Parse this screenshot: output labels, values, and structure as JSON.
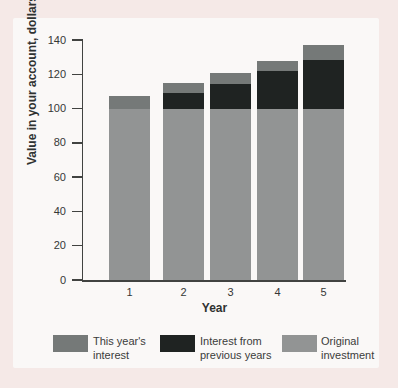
{
  "figure": {
    "background_color": "#f5e9e7",
    "panel_color": "#faf8f7"
  },
  "chart_data": {
    "type": "bar",
    "stacked": true,
    "title": "",
    "xlabel": "Year",
    "ylabel": "Value in your account, dollars",
    "categories": [
      "1",
      "2",
      "3",
      "4",
      "5"
    ],
    "series": [
      {
        "name": "Original investment",
        "color": "#929494",
        "values": [
          100,
          100,
          100,
          100,
          100
        ]
      },
      {
        "name": "Interest from previous years",
        "color": "#1f2322",
        "values": [
          0,
          9,
          14.5,
          22,
          28.5
        ]
      },
      {
        "name": "This year's interest",
        "color": "#757978",
        "values": [
          7.5,
          6,
          6,
          6,
          8.5
        ]
      }
    ],
    "totals": [
      107.5,
      115,
      120.5,
      128,
      137
    ],
    "ylim": [
      0,
      140
    ],
    "yticks": [
      0,
      20,
      40,
      60,
      80,
      100,
      120,
      140
    ],
    "grid": false,
    "legend_position": "bottom"
  },
  "legend": {
    "items": [
      {
        "label_line1": "This year's",
        "label_line2": "interest",
        "color": "#757978"
      },
      {
        "label_line1": "Interest from",
        "label_line2": "previous years",
        "color": "#1f2322"
      },
      {
        "label_line1": "Original",
        "label_line2": "investment",
        "color": "#929494"
      }
    ]
  }
}
